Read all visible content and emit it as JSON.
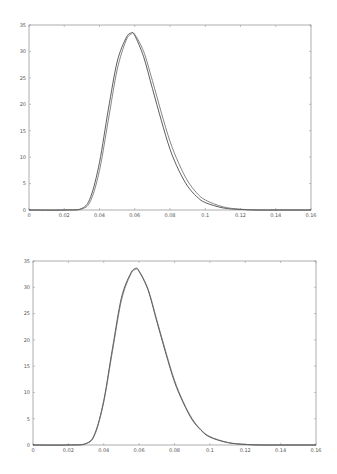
{
  "chart_data": [
    {
      "type": "line",
      "title": "",
      "xlabel": "",
      "ylabel": "",
      "xlim": [
        0,
        0.16
      ],
      "ylim": [
        0,
        35
      ],
      "xticks": [
        "0",
        "0.02",
        "0.04",
        "0.06",
        "0.08",
        "0.1",
        "0.12",
        "0.14",
        "0.16"
      ],
      "yticks": [
        "0",
        "5",
        "10",
        "15",
        "20",
        "25",
        "30",
        "35"
      ],
      "grid": false,
      "legend": null,
      "series": [
        {
          "name": "curve 1",
          "x": [
            0.02,
            0.03,
            0.035,
            0.04,
            0.045,
            0.05,
            0.055,
            0.058,
            0.06,
            0.065,
            0.07,
            0.075,
            0.08,
            0.085,
            0.09,
            0.095,
            0.1,
            0.11,
            0.12,
            0.13,
            0.14
          ],
          "values": [
            0,
            0.3,
            2.5,
            9,
            19,
            28,
            32.5,
            33.5,
            33,
            29,
            23,
            17,
            11.5,
            7.5,
            4.5,
            2.6,
            1.4,
            0.4,
            0.1,
            0,
            0
          ]
        },
        {
          "name": "curve 2",
          "x": [
            0.02,
            0.03,
            0.035,
            0.04,
            0.045,
            0.05,
            0.055,
            0.058,
            0.06,
            0.065,
            0.07,
            0.075,
            0.08,
            0.085,
            0.09,
            0.095,
            0.1,
            0.11,
            0.12,
            0.13,
            0.14
          ],
          "values": [
            0,
            0.2,
            1.8,
            7.5,
            17,
            26.5,
            32,
            33.3,
            33.2,
            30,
            24.5,
            18.5,
            13,
            8.8,
            5.5,
            3.3,
            1.9,
            0.6,
            0.15,
            0,
            0
          ]
        }
      ]
    },
    {
      "type": "line",
      "title": "",
      "xlabel": "",
      "ylabel": "",
      "xlim": [
        0,
        0.16
      ],
      "ylim": [
        0,
        35
      ],
      "xticks": [
        "0",
        "0.02",
        "0.04",
        "0.06",
        "0.08",
        "0.1",
        "0.12",
        "0.14",
        "0.16"
      ],
      "yticks": [
        "0",
        "5",
        "10",
        "15",
        "20",
        "25",
        "30",
        "35"
      ],
      "grid": false,
      "legend": null,
      "series": [
        {
          "name": "curve 1",
          "x": [
            0.02,
            0.03,
            0.035,
            0.04,
            0.045,
            0.05,
            0.055,
            0.058,
            0.06,
            0.065,
            0.07,
            0.075,
            0.08,
            0.085,
            0.09,
            0.095,
            0.1,
            0.11,
            0.12,
            0.13,
            0.14
          ],
          "values": [
            0,
            0.3,
            2.2,
            8.5,
            18.5,
            28,
            32.5,
            33.6,
            33,
            29.5,
            23.5,
            17.5,
            12,
            8,
            4.8,
            2.8,
            1.5,
            0.45,
            0.1,
            0,
            0
          ]
        },
        {
          "name": "curve 2",
          "x": [
            0.02,
            0.03,
            0.035,
            0.04,
            0.045,
            0.05,
            0.055,
            0.058,
            0.06,
            0.065,
            0.07,
            0.075,
            0.08,
            0.085,
            0.09,
            0.095,
            0.1,
            0.11,
            0.12,
            0.13,
            0.14
          ],
          "values": [
            0,
            0.25,
            2,
            8.2,
            18,
            27.5,
            32.3,
            33.4,
            33.1,
            29.7,
            23.8,
            17.8,
            12.3,
            8.2,
            5,
            2.9,
            1.6,
            0.5,
            0.12,
            0,
            0
          ]
        }
      ]
    }
  ],
  "panels": [
    {
      "left": 29,
      "right": 311,
      "top": 25,
      "bottom": 210
    },
    {
      "left": 33,
      "right": 316,
      "top": 261,
      "bottom": 445
    }
  ],
  "colors": {
    "axis": "#999999",
    "curve1": "#333333",
    "curve2": "#666666"
  }
}
